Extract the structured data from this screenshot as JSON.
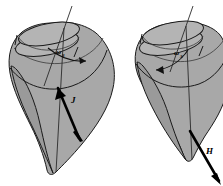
{
  "figure": {
    "background_color": "#ffffff",
    "body_fill_color": "#a8a8a8",
    "outline_color": "#1a1a1a",
    "vector_color": "#000000",
    "panels": [
      {
        "id": "left-panel",
        "name": "left-figure",
        "shape": "teardrop-top-body",
        "spin_label": "ω",
        "spin_subscript": "3",
        "spin_direction": "right",
        "vector_label": "J",
        "vector_description": "angular-momentum-vector",
        "vector_direction": "down-left-to-up-right"
      },
      {
        "id": "right-panel",
        "name": "right-figure",
        "shape": "teardrop-top-body",
        "spin_label": "ω",
        "spin_subscript": "3",
        "spin_direction": "left",
        "vector_label": "H",
        "vector_description": "angular-momentum-vector",
        "vector_direction": "up-left-to-down-right"
      }
    ]
  }
}
